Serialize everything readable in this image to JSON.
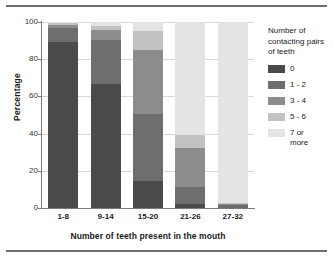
{
  "chart_data": {
    "type": "bar",
    "stacked": true,
    "title": "",
    "xlabel": "Number of teeth present in the mouth",
    "ylabel": "Percentage",
    "categories": [
      "1-8",
      "9-14",
      "15-20",
      "21-26",
      "27-32"
    ],
    "ylim": [
      0,
      100
    ],
    "yticks": [
      0,
      20,
      40,
      60,
      80,
      100
    ],
    "grid": true,
    "legend_position": "right",
    "legend_title": "Number of contacting pairs of teeth",
    "series": [
      {
        "name": "0",
        "color": "#4a4a4a",
        "values": [
          89.5,
          66.5,
          14.5,
          2.0,
          0.0
        ]
      },
      {
        "name": "1 - 2",
        "color": "#6e6e6e",
        "values": [
          7.5,
          24.0,
          36.0,
          9.5,
          1.5
        ]
      },
      {
        "name": "3 - 4",
        "color": "#8c8c8c",
        "values": [
          1.5,
          5.0,
          34.5,
          21.0,
          0.5
        ]
      },
      {
        "name": "5 - 6",
        "color": "#c2c2c2",
        "values": [
          1.0,
          2.5,
          10.0,
          7.0,
          0.5
        ]
      },
      {
        "name": "7 or\nmore",
        "color": "#e4e4e4",
        "values": [
          0.5,
          2.0,
          5.0,
          60.5,
          97.5
        ]
      }
    ]
  },
  "axes": {
    "ylabel": "Percentage",
    "xlabel": "Number of teeth present in the mouth",
    "ytick_labels": [
      "100",
      "80",
      "60",
      "40",
      "20",
      "0"
    ],
    "xtick_labels": [
      "1-8",
      "9-14",
      "15-20",
      "21-26",
      "27-32"
    ]
  },
  "legend": {
    "title": "Number of contacting pairs of teeth",
    "items": [
      {
        "label": "0",
        "color": "#4a4a4a"
      },
      {
        "label": "1 - 2",
        "color": "#6e6e6e"
      },
      {
        "label": "3 - 4",
        "color": "#8c8c8c"
      },
      {
        "label": "5 - 6",
        "color": "#c2c2c2"
      },
      {
        "label": "7 or\nmore",
        "color": "#e4e4e4"
      }
    ]
  }
}
